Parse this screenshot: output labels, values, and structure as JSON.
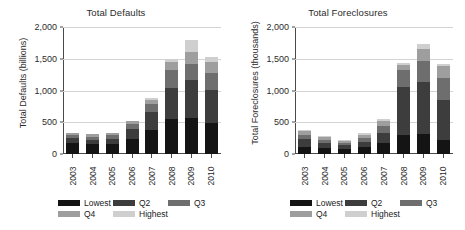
{
  "figure": {
    "categories": [
      "2003",
      "2004",
      "2005",
      "2006",
      "2007",
      "2008",
      "2009",
      "2010"
    ],
    "legend": {
      "items": [
        {
          "label": "Lowest",
          "color": "#141414"
        },
        {
          "label": "Q2",
          "color": "#3d3d3d"
        },
        {
          "label": "Q3",
          "color": "#6e6e6e"
        },
        {
          "label": "Q4",
          "color": "#9e9e9e"
        },
        {
          "label": "Highest",
          "color": "#cfcfcf"
        }
      ]
    }
  },
  "chart_data": [
    {
      "type": "bar",
      "stacked": true,
      "panel": "left",
      "title": "Total Defaults",
      "xlabel": "",
      "ylabel": "Total Defaults (billions)",
      "ylim": [
        0,
        2000
      ],
      "yticks": [
        0,
        500,
        1000,
        1500,
        2000
      ],
      "ytick_labels": [
        "0",
        "500",
        "1,000",
        "1,500",
        "2,000"
      ],
      "grid": true,
      "legend_position": "bottom-left",
      "categories": [
        "2003",
        "2004",
        "2005",
        "2006",
        "2007",
        "2008",
        "2009",
        "2010"
      ],
      "series": [
        {
          "name": "Lowest",
          "color": "#141414",
          "values": [
            170,
            150,
            160,
            235,
            375,
            545,
            570,
            495
          ]
        },
        {
          "name": "Q2",
          "color": "#3d3d3d",
          "values": [
            80,
            75,
            80,
            165,
            290,
            495,
            600,
            510
          ]
        },
        {
          "name": "Q3",
          "color": "#6e6e6e",
          "values": [
            50,
            50,
            55,
            75,
            115,
            290,
            245,
            265
          ]
        },
        {
          "name": "Q4",
          "color": "#9e9e9e",
          "values": [
            35,
            35,
            35,
            45,
            75,
            115,
            195,
            185
          ]
        },
        {
          "name": "Highest",
          "color": "#cfcfcf",
          "values": [
            0,
            0,
            0,
            5,
            30,
            55,
            180,
            80
          ]
        }
      ],
      "totals": [
        335,
        310,
        330,
        525,
        885,
        1500,
        1790,
        1535
      ]
    },
    {
      "type": "bar",
      "stacked": true,
      "panel": "right",
      "title": "Total Foreclosures",
      "xlabel": "",
      "ylabel": "Total Foreclosures (thousands)",
      "ylim": [
        0,
        2000
      ],
      "yticks": [
        0,
        500,
        1000,
        1500,
        2000
      ],
      "ytick_labels": [
        "0",
        "500",
        "1,000",
        "1,500",
        "2,000"
      ],
      "grid": true,
      "legend_position": "bottom-left",
      "categories": [
        "2003",
        "2004",
        "2005",
        "2006",
        "2007",
        "2008",
        "2009",
        "2010"
      ],
      "series": [
        {
          "name": "Lowest",
          "color": "#141414",
          "values": [
            105,
            90,
            75,
            110,
            180,
            305,
            310,
            215
          ]
        },
        {
          "name": "Q2",
          "color": "#3d3d3d",
          "values": [
            130,
            80,
            65,
            85,
            145,
            745,
            830,
            640
          ]
        },
        {
          "name": "Q3",
          "color": "#6e6e6e",
          "values": [
            65,
            55,
            40,
            60,
            110,
            270,
            330,
            350
          ]
        },
        {
          "name": "Q4",
          "color": "#9e9e9e",
          "values": [
            55,
            45,
            30,
            50,
            85,
            90,
            190,
            180
          ]
        },
        {
          "name": "Highest",
          "color": "#cfcfcf",
          "values": [
            20,
            15,
            10,
            20,
            35,
            20,
            70,
            40
          ]
        }
      ],
      "totals": [
        375,
        285,
        220,
        325,
        555,
        1430,
        1730,
        1425
      ]
    }
  ]
}
